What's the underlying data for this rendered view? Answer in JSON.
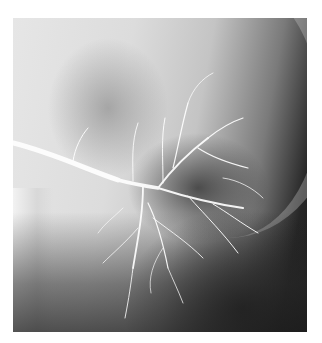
{
  "image": {
    "description": "Grayscale X-ray angiogram showing a branching contrast-filled vessel tree entering from the left",
    "colors": {
      "background": "#ffffff",
      "light_field": "#e0e0e0",
      "dark_field": "#1a1a1a",
      "vessel": "#ffffff"
    }
  }
}
